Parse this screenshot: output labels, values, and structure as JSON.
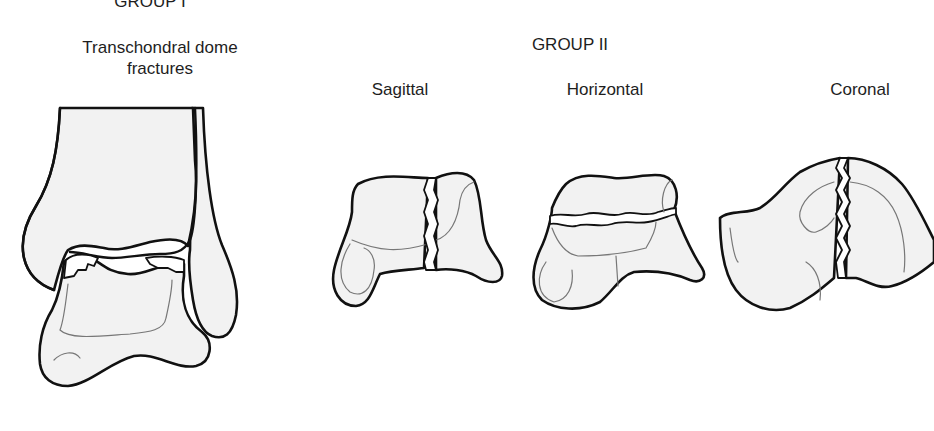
{
  "figure": {
    "group1": {
      "title": "GROUP I",
      "subtitle": "Transchondral dome fractures",
      "illustration": "ankle-joint-anterior-view"
    },
    "group2": {
      "title": "GROUP II",
      "types": [
        {
          "label": "Sagittal",
          "illustration": "talus-sagittal-fracture"
        },
        {
          "label": "Horizontal",
          "illustration": "talus-horizontal-fracture"
        },
        {
          "label": "Coronal",
          "illustration": "talus-coronal-fracture"
        }
      ]
    },
    "colors": {
      "outline": "#111111",
      "bone_fill": "#f2f2f2",
      "detail_line": "#777777",
      "background": "#ffffff"
    }
  }
}
